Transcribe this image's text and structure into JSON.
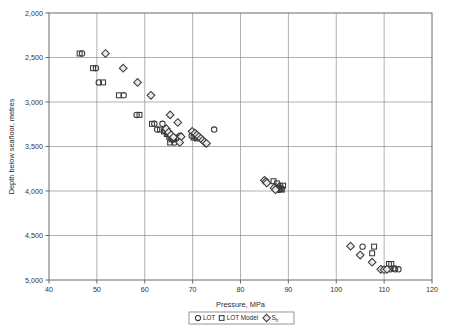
{
  "chart_data": {
    "type": "scatter",
    "title": "",
    "xlabel": "Pressure, MPa",
    "ylabel": "Depth below seafloor, metres",
    "xlim": [
      40,
      120
    ],
    "ylim": [
      2000,
      5000
    ],
    "y_inverted": true,
    "xticks": [
      40,
      50,
      60,
      70,
      80,
      90,
      100,
      110,
      120
    ],
    "yticks": [
      2000,
      2500,
      3000,
      3500,
      4000,
      4500,
      5000
    ],
    "xtick_labels": [
      "40",
      "50",
      "60",
      "70",
      "80",
      "90",
      "100",
      "110",
      "120"
    ],
    "ytick_labels": [
      "2,000",
      "2,500",
      "3,000",
      "3,500",
      "4,000",
      "4,500",
      "5,000"
    ],
    "grid": true,
    "legend_position": "bottom",
    "series": [
      {
        "name": "LOT",
        "marker": "circle",
        "color": "#3a3a3a",
        "points": [
          [
            46.9,
            2455
          ],
          [
            49.8,
            2620
          ],
          [
            50.4,
            2780
          ],
          [
            55.6,
            2925
          ],
          [
            58.3,
            3145
          ],
          [
            62.0,
            3245
          ],
          [
            62.6,
            3310
          ],
          [
            63.7,
            3245
          ],
          [
            64.3,
            3330
          ],
          [
            64.9,
            3360
          ],
          [
            65.4,
            3390
          ],
          [
            65.9,
            3420
          ],
          [
            66.7,
            3400
          ],
          [
            67.4,
            3380
          ],
          [
            66.2,
            3455
          ],
          [
            69.8,
            3380
          ],
          [
            70.6,
            3400
          ],
          [
            71.3,
            3395
          ],
          [
            74.5,
            3310
          ],
          [
            85.2,
            3890
          ],
          [
            85.4,
            3900
          ],
          [
            87.2,
            3960
          ],
          [
            87.5,
            3975
          ],
          [
            88.0,
            3985
          ],
          [
            88.3,
            3940
          ],
          [
            88.6,
            3975
          ],
          [
            105.5,
            4625
          ],
          [
            110.0,
            4880
          ],
          [
            111.3,
            4880
          ],
          [
            112.3,
            4880
          ],
          [
            113.0,
            4880
          ]
        ]
      },
      {
        "name": "LOT Model",
        "marker": "square",
        "color": "#3a3a3a",
        "points": [
          [
            46.4,
            2455
          ],
          [
            49.2,
            2620
          ],
          [
            51.3,
            2780
          ],
          [
            54.6,
            2925
          ],
          [
            58.9,
            3145
          ],
          [
            61.5,
            3245
          ],
          [
            63.2,
            3310
          ],
          [
            64.0,
            3330
          ],
          [
            64.6,
            3360
          ],
          [
            65.1,
            3390
          ],
          [
            65.6,
            3420
          ],
          [
            66.1,
            3400
          ],
          [
            65.3,
            3455
          ],
          [
            66.5,
            3415
          ],
          [
            70.2,
            3400
          ],
          [
            70.9,
            3410
          ],
          [
            86.9,
            3890
          ],
          [
            87.6,
            3915
          ],
          [
            87.9,
            3960
          ],
          [
            88.3,
            3975
          ],
          [
            88.6,
            3985
          ],
          [
            88.9,
            3940
          ],
          [
            107.9,
            4625
          ],
          [
            107.5,
            4700
          ],
          [
            111.0,
            4820
          ],
          [
            111.5,
            4820
          ],
          [
            112.0,
            4870
          ]
        ]
      },
      {
        "name": "Sh",
        "marker": "diamond",
        "color": "#3a3a3a",
        "points": [
          [
            51.8,
            2455
          ],
          [
            55.5,
            2620
          ],
          [
            58.5,
            2780
          ],
          [
            61.3,
            2925
          ],
          [
            65.3,
            3145
          ],
          [
            66.9,
            3230
          ],
          [
            67.6,
            3390
          ],
          [
            67.3,
            3455
          ],
          [
            69.9,
            3330
          ],
          [
            70.5,
            3350
          ],
          [
            70.9,
            3370
          ],
          [
            71.3,
            3390
          ],
          [
            71.7,
            3410
          ],
          [
            72.1,
            3430
          ],
          [
            72.5,
            3450
          ],
          [
            72.9,
            3465
          ],
          [
            64.5,
            3300
          ],
          [
            65.0,
            3340
          ],
          [
            65.5,
            3370
          ],
          [
            66.0,
            3395
          ],
          [
            85.0,
            3880
          ],
          [
            85.3,
            3895
          ],
          [
            85.5,
            3910
          ],
          [
            87.0,
            3965
          ],
          [
            87.3,
            3985
          ],
          [
            103.0,
            4620
          ],
          [
            105.0,
            4720
          ],
          [
            107.5,
            4800
          ],
          [
            109.3,
            4880
          ],
          [
            110.0,
            4885
          ],
          [
            110.6,
            4880
          ]
        ]
      }
    ]
  },
  "legend": {
    "items": [
      {
        "label": "LOT",
        "sub": "",
        "marker": "circle"
      },
      {
        "label": "LOT Model",
        "sub": "",
        "marker": "square"
      },
      {
        "label": "S",
        "sub": "h",
        "marker": "diamond"
      }
    ]
  }
}
